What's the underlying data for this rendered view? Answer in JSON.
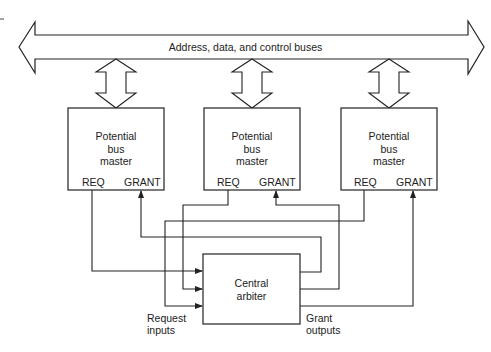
{
  "diagram": {
    "bus": {
      "label": "Address, data, and control buses"
    },
    "masters": [
      {
        "title_lines": [
          "Potential",
          "bus",
          "master"
        ],
        "req_label": "REQ",
        "grant_label": "GRANT"
      },
      {
        "title_lines": [
          "Potential",
          "bus",
          "master"
        ],
        "req_label": "REQ",
        "grant_label": "GRANT"
      },
      {
        "title_lines": [
          "Potential",
          "bus",
          "master"
        ],
        "req_label": "REQ",
        "grant_label": "GRANT"
      }
    ],
    "arbiter": {
      "title_lines": [
        "Central",
        "arbiter"
      ]
    },
    "request_inputs_lines": [
      "Request",
      "inputs"
    ],
    "grant_outputs_lines": [
      "Grant",
      "outputs"
    ],
    "colors": {
      "line": "#222222",
      "background": "#ffffff"
    }
  }
}
